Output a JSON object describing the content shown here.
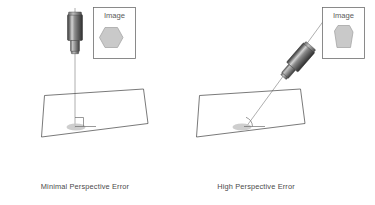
{
  "figure": {
    "background_color": "#ffffff",
    "line_color": "#4d4d4d",
    "ray_color": "#9a9a9a",
    "shape_fill": "#c9c9c9",
    "text_color": "#4a4a4a"
  },
  "panels": [
    {
      "id": "left",
      "caption": "Minimal Perspective Error",
      "image_box_label": "Image",
      "captured_shape": "regular-hexagon",
      "camera_orientation": "vertical",
      "camera_angle_deg": 0,
      "incidence_angle_label": "90",
      "angle_marker": "right-angle"
    },
    {
      "id": "right",
      "caption": "High Perspective Error",
      "image_box_label": "Image",
      "captured_shape": "keystoned-hexagon",
      "camera_orientation": "tilted",
      "camera_angle_deg": 40,
      "incidence_angle_label": "acute",
      "angle_marker": "acute-arc"
    }
  ]
}
